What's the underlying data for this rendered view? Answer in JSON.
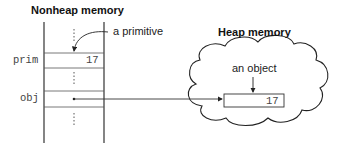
{
  "nonheap": {
    "title": "Nonheap memory",
    "annotation": "a primitive",
    "rows": [
      {
        "name": "prim",
        "value": "17"
      },
      {
        "name": "obj",
        "value": ""
      }
    ]
  },
  "heap": {
    "title": "Heap memory",
    "annotation": "an object",
    "object_value": "17"
  },
  "colors": {
    "stroke": "#222222",
    "cloud_fill": "#ffffff"
  }
}
